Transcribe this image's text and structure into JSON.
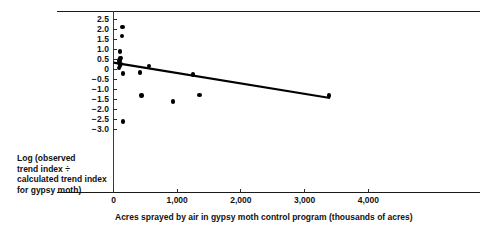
{
  "chart_data": {
    "type": "scatter",
    "title": "",
    "xlabel": "Acres sprayed by air in gypsy moth control program (thousands of acres)",
    "ylabel": "Log (observed trend index ÷ calculated trend index for gypsy moth)",
    "ylabel_lines": [
      "Log (observed",
      "trend index ÷",
      "calculated trend index",
      "for gypsy moth)"
    ],
    "xlim": [
      -120,
      4600
    ],
    "ylim": [
      -3.35,
      2.75
    ],
    "xticks": [
      0,
      1000,
      2000,
      3000,
      4000
    ],
    "xtick_labels": [
      "0",
      "1,000",
      "2,000",
      "3,000",
      "4,000"
    ],
    "yticks": [
      2.5,
      2.0,
      1.5,
      1.0,
      0.5,
      0,
      -0.5,
      -1.0,
      -1.5,
      -2.0,
      -2.5,
      -3.0
    ],
    "ytick_labels": [
      "2.5",
      "2.0",
      "1.5",
      "1.0",
      "0.5",
      "0",
      "−0.5",
      "−1.0",
      "−1.5",
      "−2.0",
      "−2.5",
      "−3.0"
    ],
    "grid": false,
    "legend": "none",
    "marker_color": "#000000",
    "axis_color": "#1a1a1a",
    "trendline_color": "#000000",
    "points": [
      {
        "x": 140,
        "y": 2.1
      },
      {
        "x": 130,
        "y": 1.65
      },
      {
        "x": 105,
        "y": 0.88
      },
      {
        "x": 110,
        "y": 0.55
      },
      {
        "x": 95,
        "y": 0.42
      },
      {
        "x": 90,
        "y": 0.3
      },
      {
        "x": 100,
        "y": 0.18
      },
      {
        "x": 85,
        "y": 0.05
      },
      {
        "x": 120,
        "y": 0.25
      },
      {
        "x": 150,
        "y": -0.22
      },
      {
        "x": 420,
        "y": -0.18
      },
      {
        "x": 560,
        "y": 0.16
      },
      {
        "x": 1250,
        "y": -0.27
      },
      {
        "x": 440,
        "y": -1.33
      },
      {
        "x": 930,
        "y": -1.62
      },
      {
        "x": 1350,
        "y": -1.3
      },
      {
        "x": 3380,
        "y": -1.33
      },
      {
        "x": 150,
        "y": -2.62
      }
    ],
    "trendline": {
      "type": "line",
      "x_start": 0,
      "y_start": 0.32,
      "x_end": 3400,
      "y_end": -1.45
    }
  }
}
